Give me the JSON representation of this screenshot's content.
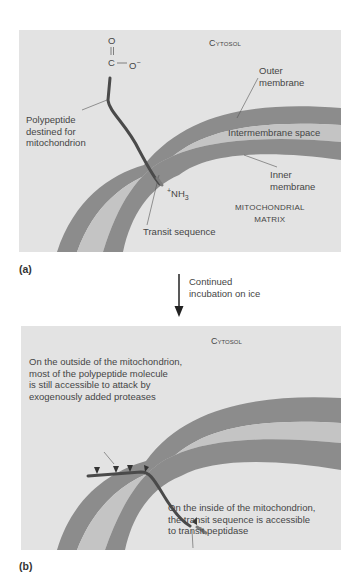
{
  "figure": {
    "panel_a": {
      "label": "(a)",
      "cytosol_label": "Cytosol",
      "carboxyl_O_top": "O",
      "carboxyl_C": "C",
      "carboxyl_dash": "—",
      "carboxyl_O_minus": "O",
      "carboxyl_charge": "−",
      "polypeptide_label": [
        "Polypeptide",
        "destined for",
        "mitochondrion"
      ],
      "outer_membrane_label": [
        "Outer",
        "membrane"
      ],
      "intermembrane_label": "Intermembrane space",
      "inner_membrane_label": [
        "Inner",
        "membrane"
      ],
      "nh3_plus": "+",
      "nh3_label": "NH",
      "nh3_sub": "3",
      "transit_label": "Transit sequence",
      "matrix_label": [
        "Mitochondrial",
        "Matrix"
      ]
    },
    "transition": {
      "text": [
        "Continued",
        "incubation on ice"
      ]
    },
    "panel_b": {
      "label": "(b)",
      "cytosol_label": "Cytosol",
      "outside_note": [
        "On the outside of the mitochondrion,",
        "most of the polypeptide molecule",
        "is still accessible to attack by",
        "exogenously added proteases"
      ],
      "inside_note": [
        "On the inside of the mitochondrion,",
        "the transit sequence is accessible",
        "to transit peptidase"
      ]
    },
    "colors": {
      "panel_bg": "#e3e3e3",
      "membrane": "#8c8c8c",
      "intermembrane": "#c4c4c4",
      "polypeptide": "#4a4a4a",
      "text": "#454545"
    }
  }
}
